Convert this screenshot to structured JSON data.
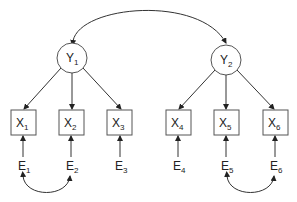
{
  "diagram": {
    "type": "structural-equation-model",
    "latent": [
      {
        "id": "Y1",
        "base": "Y",
        "sub": "1"
      },
      {
        "id": "Y2",
        "base": "Y",
        "sub": "2"
      }
    ],
    "observed": [
      {
        "id": "X1",
        "base": "X",
        "sub": "1"
      },
      {
        "id": "X2",
        "base": "X",
        "sub": "2"
      },
      {
        "id": "X3",
        "base": "X",
        "sub": "3"
      },
      {
        "id": "X4",
        "base": "X",
        "sub": "4"
      },
      {
        "id": "X5",
        "base": "X",
        "sub": "5"
      },
      {
        "id": "X6",
        "base": "X",
        "sub": "6"
      }
    ],
    "errors": [
      {
        "id": "E1",
        "base": "E",
        "sub": "1"
      },
      {
        "id": "E2",
        "base": "E",
        "sub": "2"
      },
      {
        "id": "E3",
        "base": "E",
        "sub": "3"
      },
      {
        "id": "E4",
        "base": "E",
        "sub": "4"
      },
      {
        "id": "E5",
        "base": "E",
        "sub": "5"
      },
      {
        "id": "E6",
        "base": "E",
        "sub": "6"
      }
    ],
    "edges": [
      {
        "from": "Y1",
        "to": "X1"
      },
      {
        "from": "Y1",
        "to": "X2"
      },
      {
        "from": "Y1",
        "to": "X3"
      },
      {
        "from": "Y2",
        "to": "X4"
      },
      {
        "from": "Y2",
        "to": "X5"
      },
      {
        "from": "Y2",
        "to": "X6"
      },
      {
        "from": "E1",
        "to": "X1"
      },
      {
        "from": "E2",
        "to": "X2"
      },
      {
        "from": "E3",
        "to": "X3"
      },
      {
        "from": "E4",
        "to": "X4"
      },
      {
        "from": "E5",
        "to": "X5"
      },
      {
        "from": "E6",
        "to": "X6"
      }
    ],
    "covariances": [
      {
        "a": "Y1",
        "b": "Y2"
      },
      {
        "a": "E1",
        "b": "E2"
      },
      {
        "a": "E5",
        "b": "E6"
      }
    ]
  }
}
